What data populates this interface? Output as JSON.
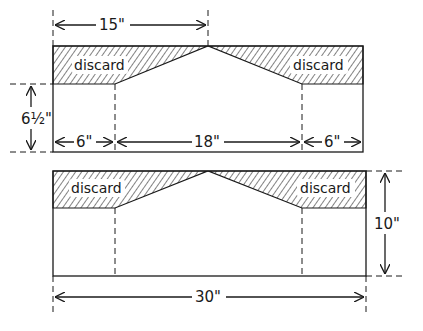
{
  "diagram": {
    "top_panel": {
      "discard_left": "discard",
      "discard_right": "discard",
      "dim_peak_width": "15\"",
      "dim_height": "6½\"",
      "dim_left": "6\"",
      "dim_middle": "18\"",
      "dim_right": "6\""
    },
    "bottom_panel": {
      "discard_left": "discard",
      "discard_right": "discard",
      "dim_height": "10\"",
      "dim_total_width": "30\""
    }
  }
}
